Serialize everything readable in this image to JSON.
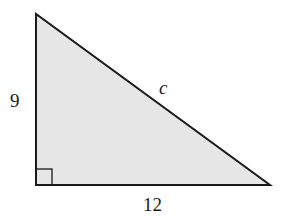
{
  "diagram": {
    "type": "right-triangle",
    "fill_color": "#e6e6e6",
    "stroke_color": "#1a1a1a",
    "vertices": {
      "top": [
        36,
        14
      ],
      "right_angle": [
        36,
        185
      ],
      "right": [
        270,
        185
      ]
    },
    "labels": {
      "vertical_leg": "9",
      "horizontal_leg": "12",
      "hypotenuse": "c"
    },
    "right_angle_marker": true
  }
}
